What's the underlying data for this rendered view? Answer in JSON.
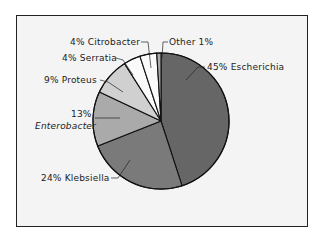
{
  "chart_data": {
    "type": "pie",
    "title": "",
    "start_angle": "12 o'clock",
    "direction": "clockwise",
    "slices": [
      {
        "label": "Escherichia",
        "pct_label": "45%",
        "value": 45,
        "color": "#666666",
        "text": "45% Escherichia"
      },
      {
        "label": "Klebsiella",
        "pct_label": "24%",
        "value": 24,
        "color": "#7a7a7a",
        "text": "24% Klebsiella"
      },
      {
        "label": "Enterobacter",
        "pct_label": "13%",
        "value": 13,
        "color": "#aaaaaa",
        "text_pct": "13%",
        "text_name": "Enterobacter"
      },
      {
        "label": "Proteus",
        "pct_label": "9%",
        "value": 9,
        "color": "#d0d0d0",
        "text": "9% Proteus"
      },
      {
        "label": "Serratia",
        "pct_label": "4%",
        "value": 4,
        "color": "#fafafa",
        "text": "4% Serratia"
      },
      {
        "label": "Citrobacter",
        "pct_label": "4%",
        "value": 4,
        "color": "#fafafa",
        "text": "4% Citrobacter"
      },
      {
        "label": "Other",
        "pct_label": "1%",
        "value": 1,
        "color": "#aaaaaa",
        "text": "Other 1%"
      }
    ],
    "categories": [
      "Escherichia",
      "Klebsiella",
      "Enterobacter",
      "Proteus",
      "Serratia",
      "Citrobacter",
      "Other"
    ],
    "values": [
      45,
      24,
      13,
      9,
      4,
      4,
      1
    ],
    "legend": "none (leader-line labels)"
  }
}
